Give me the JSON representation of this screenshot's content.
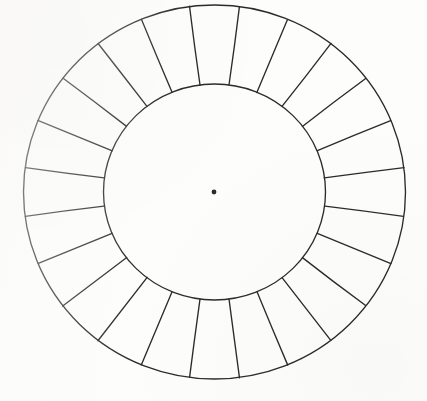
{
  "document": {
    "title": "Color Wheel Template",
    "type": "blank-color-wheel-diagram",
    "background_color": "#fdfdfc",
    "ink_color": "#2b2b2b",
    "width": 427,
    "height": 401
  },
  "chart_data": {
    "type": "pie",
    "subtitle": "",
    "xlabel": "",
    "ylabel": "",
    "legend": [],
    "annotations": [],
    "grid": false,
    "segment_count": 24,
    "segment_angle_degrees": 15,
    "start_angle_offset_degrees": -7.5,
    "categories": [
      "segment-1",
      "segment-2",
      "segment-3",
      "segment-4",
      "segment-5",
      "segment-6",
      "segment-7",
      "segment-8",
      "segment-9",
      "segment-10",
      "segment-11",
      "segment-12",
      "segment-13",
      "segment-14",
      "segment-15",
      "segment-16",
      "segment-17",
      "segment-18",
      "segment-19",
      "segment-20",
      "segment-21",
      "segment-22",
      "segment-23",
      "segment-24"
    ],
    "values": [
      15,
      15,
      15,
      15,
      15,
      15,
      15,
      15,
      15,
      15,
      15,
      15,
      15,
      15,
      15,
      15,
      15,
      15,
      15,
      15,
      15,
      15,
      15,
      15
    ],
    "fills": [
      "none",
      "none",
      "none",
      "none",
      "none",
      "none",
      "none",
      "none",
      "none",
      "none",
      "none",
      "none",
      "none",
      "none",
      "none",
      "none",
      "none",
      "none",
      "none",
      "none",
      "none",
      "none",
      "none",
      "none"
    ],
    "geometry": {
      "center_x": 214.5,
      "center_y": 192,
      "outer_radius_x": 191,
      "outer_radius_y": 187,
      "inner_radius_x": 111,
      "inner_radius_y": 108,
      "center_dot_radius": 2.4,
      "stroke_width": 1.35
    }
  },
  "labels": {
    "center_dot": "center-point",
    "outer_ring": "outer-ring-boundary",
    "inner_circle": "inner-circle-boundary",
    "segments_group": "radial-segments"
  }
}
